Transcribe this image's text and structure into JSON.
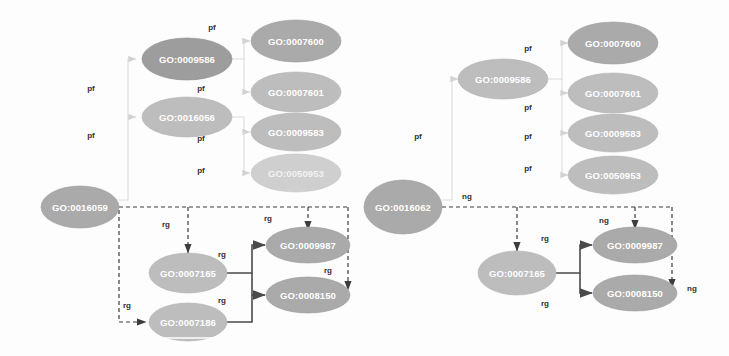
{
  "figure": {
    "width": 729,
    "height": 356,
    "background": "#ffffff"
  },
  "palette": {
    "node_fill_dark": "#9d9d9d",
    "node_fill_mid": "#aaaaaa",
    "node_fill_light": "#bdbdbd",
    "node_fill_pale": "#cfcfcf",
    "node_text": "#ffffff",
    "edge_solid": "#4a4a4a",
    "edge_dashed": "#3d3d3d",
    "edge_faint": "#dcdcdc",
    "edge_label_text": "#2f2f2f"
  },
  "left_graph": {
    "nodes": {
      "root": "GO:0016059",
      "mid_upper": "GO:0009586",
      "mid_lower": "GO:0016056",
      "leaf_1": "GO:0007600",
      "leaf_2": "GO:0007601",
      "leaf_3": "GO:0009583",
      "leaf_4": "GO:0050953",
      "sig_1": "GO:0007165",
      "sig_2": "GO:0007186",
      "sig_3": "GO:0009987",
      "sig_4": "GO:0008150"
    },
    "edge_labels": {
      "pf_a": "pf",
      "pf_b": "pf",
      "pf_c": "pf",
      "pf_d": "pf",
      "pf_e": "pf",
      "pf_f": "pf",
      "pf_g": "pf",
      "rg_a": "rg",
      "rg_b": "rg",
      "rg_c": "rg",
      "rg_d": "rg",
      "rg_e": "rg",
      "rg_f": "rg"
    }
  },
  "right_graph": {
    "nodes": {
      "root": "GO:0016062",
      "mid_upper": "GO:0009586",
      "leaf_1": "GO:0007600",
      "leaf_2": "GO:0007601",
      "leaf_3": "GO:0009583",
      "leaf_4": "GO:0050953",
      "sig_1": "GO:0007165",
      "sig_3": "GO:0009987",
      "sig_4": "GO:0008150"
    },
    "edge_labels": {
      "pf_a": "pf",
      "pf_b": "pf",
      "pf_c": "pf",
      "pf_d": "pf",
      "pf_e": "pf",
      "pf_f": "pf",
      "ng_a": "ng",
      "ng_b": "ng",
      "ng_c": "ng",
      "rg_a": "rg",
      "rg_b": "rg"
    }
  }
}
